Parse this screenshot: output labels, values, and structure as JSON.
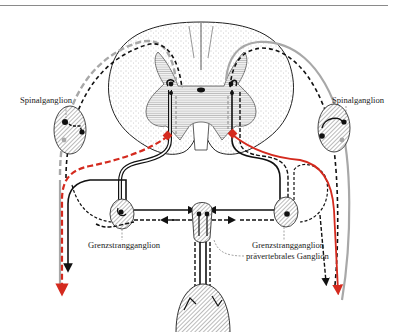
{
  "figure": {
    "labels": {
      "spinal_ganglion_left": "Spinalganglion",
      "spinal_ganglion_right": "Spinalganglion",
      "sympathetic_chain_ganglion_left": "Grenzstrangganglion",
      "sympathetic_chain_ganglion_right": "Grenzstrangganglion",
      "prevertebral_ganglion": "prävertebrales Ganglion"
    },
    "colors": {
      "line_black": "#111111",
      "line_gray": "#a8a8a8",
      "line_red": "#d42a1e",
      "stipple": "#cfcfcf",
      "hatch": "#555555",
      "rule": "#8a8a8a"
    }
  }
}
